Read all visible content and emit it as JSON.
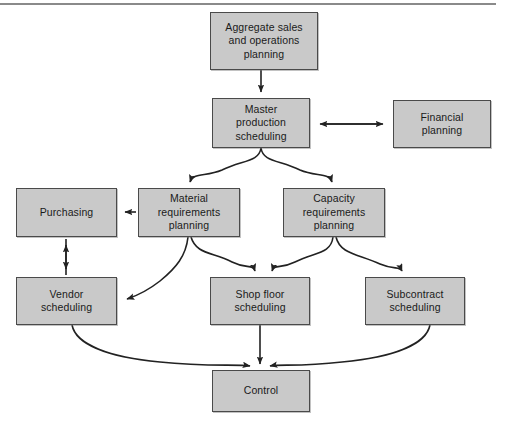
{
  "diagram": {
    "type": "flow-diagram",
    "box_fill": "#c9c9c9",
    "box_border": "#4a4a4a",
    "arrow_color": "#222222",
    "rule_color": "#8a8a8a",
    "nodes": [
      {
        "id": "aggregate",
        "label": "Aggregate sales\nand operations\nplanning",
        "x": 210,
        "y": 12,
        "w": 108,
        "h": 58
      },
      {
        "id": "master",
        "label": "Master\nproduction\nscheduling",
        "x": 212,
        "y": 98,
        "w": 98,
        "h": 50
      },
      {
        "id": "financial",
        "label": "Financial\nplanning",
        "x": 393,
        "y": 100,
        "w": 98,
        "h": 48
      },
      {
        "id": "purchasing",
        "label": "Purchasing",
        "x": 16,
        "y": 188,
        "w": 101,
        "h": 49
      },
      {
        "id": "material",
        "label": "Material\nrequirements\nplanning",
        "x": 138,
        "y": 188,
        "w": 102,
        "h": 49
      },
      {
        "id": "capacity",
        "label": "Capacity\nrequirements\nplanning",
        "x": 283,
        "y": 188,
        "w": 102,
        "h": 49
      },
      {
        "id": "vendor",
        "label": "Vendor\nscheduling",
        "x": 16,
        "y": 277,
        "w": 101,
        "h": 48
      },
      {
        "id": "shopfloor",
        "label": "Shop floor\nscheduling",
        "x": 210,
        "y": 277,
        "w": 100,
        "h": 48
      },
      {
        "id": "subcontract",
        "label": "Subcontract\nscheduling",
        "x": 365,
        "y": 277,
        "w": 100,
        "h": 48
      },
      {
        "id": "control",
        "label": "Control",
        "x": 212,
        "y": 370,
        "w": 98,
        "h": 42
      }
    ],
    "edges": [
      {
        "id": "aggregate-to-master",
        "from": "aggregate",
        "to": "master",
        "style": "straight-down",
        "arrows": "one-way"
      },
      {
        "id": "master-to-financial",
        "from": "master",
        "to": "financial",
        "style": "horizontal",
        "arrows": "two-way"
      },
      {
        "id": "master-to-material",
        "from": "master",
        "to": "material",
        "style": "curve-left-down",
        "arrows": "one-way"
      },
      {
        "id": "master-to-capacity",
        "from": "master",
        "to": "capacity",
        "style": "curve-right-down",
        "arrows": "one-way"
      },
      {
        "id": "material-to-purchasing",
        "from": "material",
        "to": "purchasing",
        "style": "horizontal",
        "arrows": "one-way"
      },
      {
        "id": "purchasing-to-vendor",
        "from": "purchasing",
        "to": "vendor",
        "style": "vertical",
        "arrows": "two-way"
      },
      {
        "id": "material-to-vendor",
        "from": "material",
        "to": "vendor",
        "style": "curve-left-down",
        "arrows": "one-way"
      },
      {
        "id": "material-to-shopfloor",
        "from": "material",
        "to": "shopfloor",
        "style": "curve-right-down",
        "arrows": "one-way"
      },
      {
        "id": "capacity-to-shopfloor",
        "from": "capacity",
        "to": "shopfloor",
        "style": "curve-left-down",
        "arrows": "one-way"
      },
      {
        "id": "capacity-to-subcontract",
        "from": "capacity",
        "to": "subcontract",
        "style": "curve-right-down",
        "arrows": "one-way"
      },
      {
        "id": "vendor-to-control",
        "from": "vendor",
        "to": "control",
        "style": "curve-right-down",
        "arrows": "one-way"
      },
      {
        "id": "shopfloor-to-control",
        "from": "shopfloor",
        "to": "control",
        "style": "straight-down",
        "arrows": "one-way"
      },
      {
        "id": "subcontract-to-control",
        "from": "subcontract",
        "to": "control",
        "style": "curve-left-down",
        "arrows": "one-way"
      }
    ]
  }
}
